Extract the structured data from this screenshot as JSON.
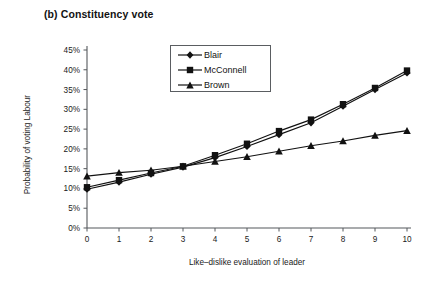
{
  "chart_data": {
    "type": "line",
    "title": "(b) Constituency vote",
    "xlabel": "Like–dislike evaluation of leader",
    "ylabel": "Probability of voting Labour",
    "x": [
      0,
      1,
      2,
      3,
      4,
      5,
      6,
      7,
      8,
      9,
      10
    ],
    "xtick_labels": [
      "0",
      "1",
      "2",
      "3",
      "4",
      "5",
      "6",
      "7",
      "8",
      "9",
      "10"
    ],
    "ytick_labels": [
      "0%",
      "5%",
      "10%",
      "15%",
      "20%",
      "25%",
      "30%",
      "35%",
      "40%",
      "45%"
    ],
    "ytick_values": [
      0,
      5,
      10,
      15,
      20,
      25,
      30,
      35,
      40,
      45
    ],
    "xlim": [
      0,
      10
    ],
    "ylim": [
      0,
      45
    ],
    "grid": false,
    "legend_position": "upper-center",
    "series": [
      {
        "name": "Blair",
        "marker": "diamond",
        "color": "#111111",
        "values": [
          9.8,
          11.6,
          13.6,
          15.4,
          17.8,
          20.6,
          23.6,
          26.6,
          30.8,
          35.0,
          39.2
        ]
      },
      {
        "name": "McConnell",
        "marker": "square",
        "color": "#111111",
        "values": [
          10.3,
          12.1,
          13.9,
          15.6,
          18.4,
          21.3,
          24.5,
          27.4,
          31.3,
          35.4,
          39.8
        ]
      },
      {
        "name": "Brown",
        "marker": "triangle",
        "color": "#111111",
        "values": [
          13.1,
          14.0,
          14.6,
          15.6,
          16.8,
          18.0,
          19.4,
          20.8,
          22.0,
          23.4,
          24.6
        ]
      }
    ]
  }
}
